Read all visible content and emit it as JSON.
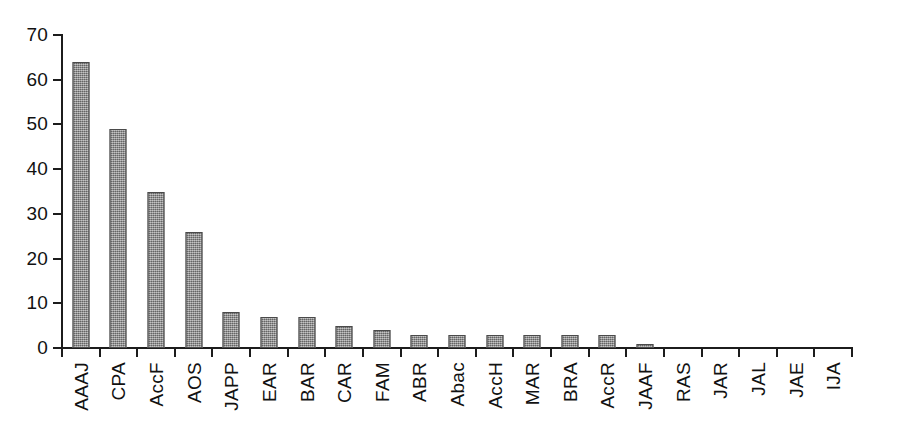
{
  "chart_data": {
    "type": "bar",
    "title": "",
    "subtitle": "",
    "xlabel": "",
    "ylabel": "",
    "categories": [
      "AAAJ",
      "CPA",
      "AccF",
      "AOS",
      "JAPP",
      "EAR",
      "BAR",
      "CAR",
      "FAM",
      "ABR",
      "Abac",
      "AccH",
      "MAR",
      "BRA",
      "AccR",
      "JAAF",
      "RAS",
      "JAR",
      "JAL",
      "JAE",
      "IJA"
    ],
    "values": [
      64,
      49,
      35,
      26,
      8,
      7,
      7,
      5,
      4,
      3,
      3,
      3,
      3,
      3,
      3,
      1,
      0,
      0,
      0,
      0,
      0
    ],
    "ylim": [
      0,
      70
    ],
    "ytick_labels": [
      "0",
      "10",
      "20",
      "30",
      "40",
      "50",
      "60",
      "70"
    ],
    "ytick_values": [
      0,
      10,
      20,
      30,
      40,
      50,
      60,
      70
    ],
    "grid": false,
    "legend": false,
    "legend_position": "none",
    "bar_color": "#8c8c8c",
    "bar_edge_color": "#4a4a4a",
    "axis_color": "#1c1c1c",
    "background_color": "#ffffff",
    "xtick_label_rotation": 90
  }
}
